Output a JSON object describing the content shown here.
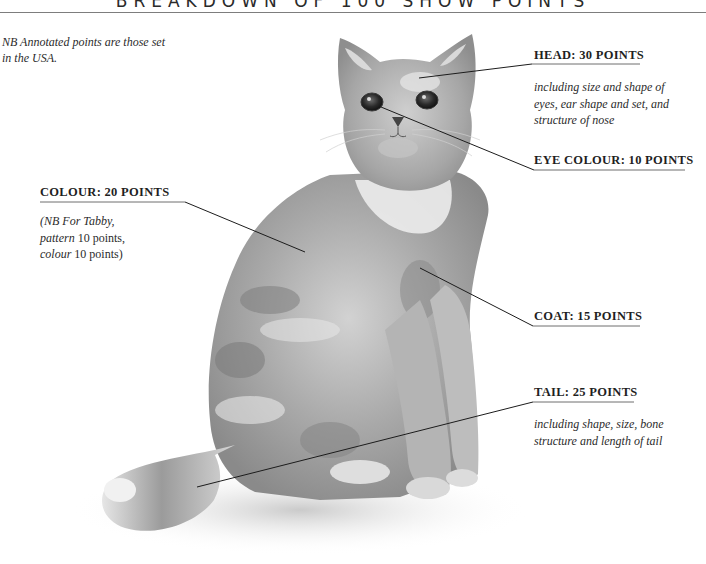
{
  "header": {
    "title": "BREAKDOWN OF 100 SHOW POINTS"
  },
  "note": "NB Annotated points are those set in the USA.",
  "colors": {
    "ink": "#1e1e1e",
    "rule": "#7d7d7d",
    "fur": "#9a9a9a"
  },
  "annotations": [
    {
      "id": "head",
      "label": "HEAD: 30 POINTS",
      "description": "including size and shape of eyes, ear shape and set, and structure of nose"
    },
    {
      "id": "eye-colour",
      "label": "EYE COLOUR: 10 POINTS"
    },
    {
      "id": "colour",
      "label": "COLOUR: 20 POINTS",
      "description_parts": [
        {
          "text": "(NB For Tabby,",
          "italic": true
        },
        {
          "text": "pattern",
          "italic": true
        },
        {
          "text": " 10 points,",
          "italic": false
        },
        {
          "text": "colour",
          "italic": true
        },
        {
          "text": " 10 points)",
          "italic": false
        }
      ]
    },
    {
      "id": "coat",
      "label": "COAT: 15 POINTS"
    },
    {
      "id": "tail",
      "label": "TAIL: 25 POINTS",
      "description": "including shape, size, bone structure and length of tail"
    }
  ],
  "illustration": {
    "subject": "seated cat (pencil illustration)"
  }
}
